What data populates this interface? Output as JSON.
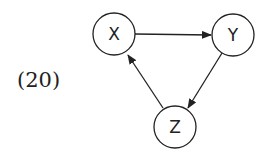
{
  "equation_label": "(20)",
  "diagram": {
    "type": "directed-graph",
    "nodes": [
      {
        "id": "X",
        "label": "X",
        "cx": 114,
        "cy": 34,
        "r": 21
      },
      {
        "id": "Y",
        "label": "Y",
        "cx": 233,
        "cy": 35,
        "r": 21
      },
      {
        "id": "Z",
        "label": "Z",
        "cx": 175,
        "cy": 127,
        "r": 21
      }
    ],
    "edges": [
      {
        "from": "X",
        "to": "Y"
      },
      {
        "from": "Y",
        "to": "Z"
      },
      {
        "from": "Z",
        "to": "X"
      }
    ],
    "stroke_color": "#222222"
  }
}
